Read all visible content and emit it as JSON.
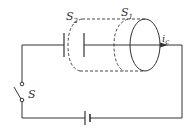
{
  "diagram": {
    "type": "circuit",
    "labels": {
      "surface_s2": "S",
      "surface_s2_sub": "2",
      "surface_s1": "S",
      "surface_s1_sub": "1",
      "current": "i",
      "current_sub": "c",
      "switch": "S"
    },
    "colors": {
      "line": "#333333",
      "background": "#ffffff"
    },
    "components": [
      "capacitor",
      "battery",
      "switch",
      "wire",
      "ampere-loop-ellipse",
      "dashed-surface-s1",
      "dashed-surface-s2",
      "current-arrow"
    ]
  }
}
